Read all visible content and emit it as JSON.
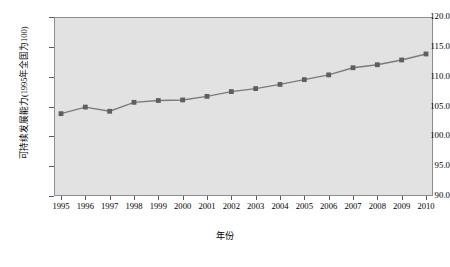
{
  "chart_data": {
    "type": "line",
    "title": "",
    "xlabel": "年份",
    "ylabel": "可持续发展能力(1995年全国为100)",
    "x": [
      1995,
      1996,
      1997,
      1998,
      1999,
      2000,
      2001,
      2002,
      2003,
      2004,
      2005,
      2006,
      2007,
      2008,
      2009,
      2010
    ],
    "categories": [
      "1995",
      "1996",
      "1997",
      "1998",
      "1999",
      "2000",
      "2001",
      "2002",
      "2003",
      "2004",
      "2005",
      "2006",
      "2007",
      "2008",
      "2009",
      "2010"
    ],
    "values": [
      103.8,
      104.9,
      104.2,
      105.7,
      106.0,
      106.1,
      106.7,
      107.5,
      108.0,
      108.7,
      109.5,
      110.3,
      111.5,
      112.0,
      112.8,
      113.8
    ],
    "series": [
      {
        "name": "可持续发展能力",
        "values": [
          103.8,
          104.9,
          104.2,
          105.7,
          106.0,
          106.1,
          106.7,
          107.5,
          108.0,
          108.7,
          109.5,
          110.3,
          111.5,
          112.0,
          112.8,
          113.8
        ]
      }
    ],
    "ylim": [
      90.0,
      120.0
    ],
    "yticks": [
      90.0,
      95.0,
      100.0,
      105.0,
      110.0,
      115.0,
      120.0
    ],
    "ytick_labels": [
      "90.0",
      "95.0",
      "100.0",
      "105.0",
      "110.0",
      "115.0",
      "120.0"
    ],
    "xlim": [
      1995,
      2010
    ],
    "grid": false,
    "legend": false,
    "marker": "square",
    "line_color": "#7b7b7b",
    "marker_color": "#5e5e5e",
    "plot_background": "#e2e2e2",
    "figure_background": "#ffffff"
  }
}
